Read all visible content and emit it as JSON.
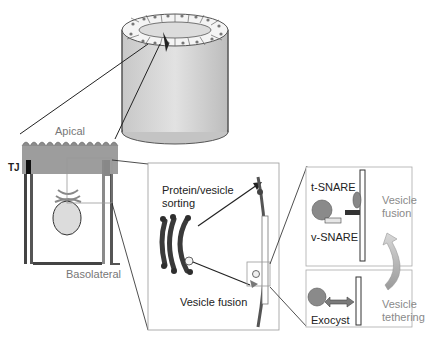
{
  "diagram": {
    "type": "epithelial-cell-exocytosis-schematic",
    "labels": {
      "apical": "Apical",
      "basolateral": "Basolateral",
      "tj": "TJ",
      "protein_sorting_line1": "Protein/vesicle",
      "protein_sorting_line2": "sorting",
      "vesicle_fusion_center": "Vesicle fusion",
      "t_snare": "t-SNARE",
      "v_snare": "v-SNARE",
      "exocyst": "Exocyst",
      "vesicle_fusion_right_line1": "Vesicle",
      "vesicle_fusion_right_line2": "fusion",
      "vesicle_tethering_line1": "Vesicle",
      "vesicle_tethering_line2": "tethering"
    },
    "panels": [
      {
        "id": "tube",
        "description": "Epithelial tube (cylinder) with ring of cells"
      },
      {
        "id": "cell",
        "description": "Polarized epithelial cell with microvilli, TJ, Golgi and nucleus"
      },
      {
        "id": "golgi-zoom",
        "description": "Golgi to plasma membrane trafficking"
      },
      {
        "id": "fusion-zoom",
        "description": "SNARE-mediated vesicle fusion"
      },
      {
        "id": "tethering-zoom",
        "description": "Exocyst-mediated vesicle tethering"
      }
    ],
    "colors": {
      "structure_grey": "#8c8c8c",
      "dark": "#1a1a1a",
      "light_fill": "#d9d9d9",
      "label_grey": "#8a8a8a",
      "panel_border": "#9a9a9a"
    }
  }
}
